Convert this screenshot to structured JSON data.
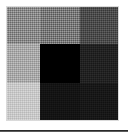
{
  "figure": {
    "kind": "grayscale-grid-swatch",
    "background_color": "#ffffff",
    "border_color": "#969696"
  },
  "chart_data": {
    "type": "heatmap",
    "title": "",
    "subtitle": "",
    "xlabel": "",
    "ylabel": "",
    "legend": [],
    "grid": false,
    "rows": 3,
    "cols": 3,
    "x": [
      "col-1",
      "col-2",
      "col-3"
    ],
    "categories": [
      "row-1",
      "row-2",
      "row-3"
    ],
    "colorscale": "grayscale",
    "value_range": [
      0,
      1
    ],
    "values": [
      [
        0.47,
        0.56,
        0.72
      ],
      [
        0.35,
        1.0,
        0.86
      ],
      [
        0.22,
        0.92,
        0.9
      ]
    ],
    "cell_colors": [
      [
        "#8a8a8a",
        "#7a7a7a",
        "#4c4c4c"
      ],
      [
        "#a9a9a9",
        "#000000",
        "#222222"
      ],
      [
        "#c8c8c8",
        "#141414",
        "#181818"
      ]
    ],
    "cell_labels": [
      [
        "",
        "",
        ""
      ],
      [
        "",
        "",
        ""
      ],
      [
        "",
        "",
        ""
      ]
    ]
  },
  "divider": {
    "color": "#2a2a2a"
  }
}
